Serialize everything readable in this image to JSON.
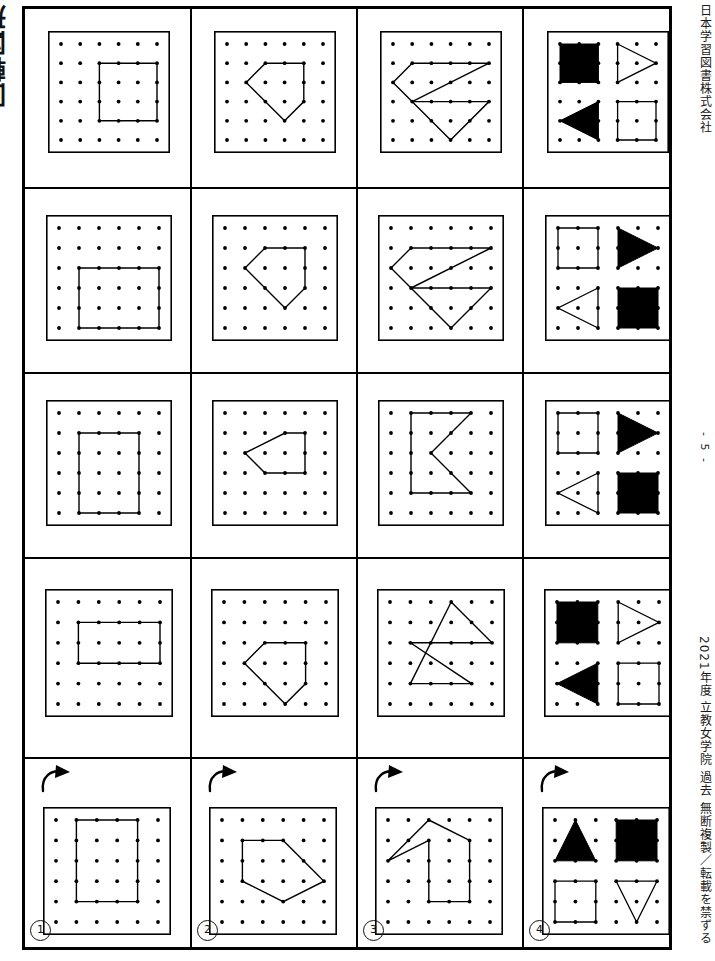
{
  "document": {
    "title": "回転図形",
    "publisher": "日本学習図書株式会社",
    "page_number": "- 5 -",
    "copyright": "2021年度 立教女学院 過去 無断複製／転載を禁ずる"
  },
  "legend": {
    "rotation_arrow_icon": "rotate-clockwise-arrow",
    "grid_rows": 6,
    "grid_cols": 6,
    "dot_color": "#000000",
    "line_color": "#000000",
    "fill_color": "#000000",
    "border_color": "#000000"
  },
  "questions": [
    {
      "number": "①",
      "label": "1"
    },
    {
      "number": "②",
      "label": "2"
    },
    {
      "number": "③",
      "label": "3"
    },
    {
      "number": "④",
      "label": "4"
    }
  ],
  "columns": [
    {
      "index": 1,
      "name": "question-column-1",
      "shape_kind": "rectangle"
    },
    {
      "index": 2,
      "name": "question-column-2",
      "shape_kind": "pentagon"
    },
    {
      "index": 3,
      "name": "question-column-3",
      "shape_kind": "zigzag-arrow"
    },
    {
      "index": 4,
      "name": "question-column-4",
      "shape_kind": "four-quadrant-shapes"
    }
  ],
  "rows": [
    {
      "index": 1,
      "name": "answer-row-a",
      "kind": "answer"
    },
    {
      "index": 2,
      "name": "answer-row-b",
      "kind": "answer"
    },
    {
      "index": 3,
      "name": "answer-row-c",
      "kind": "answer"
    },
    {
      "index": 4,
      "name": "answer-row-d",
      "kind": "answer"
    },
    {
      "index": 5,
      "name": "problem-row",
      "kind": "problem"
    }
  ],
  "boards": {
    "c1r1": {
      "name": "board-col1-row1",
      "type": "polyline",
      "points": "2,1 5,1 5,4 2,4 2,1"
    },
    "c1r2": {
      "name": "board-col1-row2",
      "type": "polyline",
      "points": "1,2 5,2 5,5 1,5 1,2"
    },
    "c1r3": {
      "name": "board-col1-row3",
      "type": "polyline",
      "points": "1,1 4,1 4,5 1,5 1,1"
    },
    "c1r4": {
      "name": "board-col1-row4",
      "type": "polyline",
      "points": "1,1 5,1 5,3 1,3 1,1"
    },
    "c1r5": {
      "name": "board-col1-problem",
      "type": "polyline",
      "points": "1,0 4,0 4,4 1,4 1,0"
    },
    "c2r1": {
      "name": "board-col2-row1",
      "type": "polyline",
      "points": "2,1 4,1 4,3 3,4 1,2 2,1"
    },
    "c2r2": {
      "name": "board-col2-row2",
      "type": "polyline",
      "points": "2,1 4,1 4,3 3,4 1,2 2,1"
    },
    "c2r3": {
      "name": "board-col2-row3",
      "type": "polyline",
      "points": "1,2 3,1 4,1 4,3 2,3 1,2"
    },
    "c2r4": {
      "name": "board-col2-row4",
      "type": "polyline",
      "points": "2,2 4,2 4,4 3,5 1,3 2,2"
    },
    "c2r5": {
      "name": "board-col2-problem",
      "type": "polyline",
      "points": "1,1 3,1 5,3 3,4 1,3 1,1"
    },
    "c3r1": {
      "name": "board-col3-row1",
      "type": "polyline",
      "points": "1,1 5,1 1,3 5,3 3,5 0,2 1,1"
    },
    "c3r2": {
      "name": "board-col3-row2",
      "type": "polyline",
      "points": "1,1 5,1 1,3 5,3 3,5 0,2 1,1"
    },
    "c3r3": {
      "name": "board-col3-row3",
      "type": "polyline",
      "points": "1,0 4,0 2,2 4,4 1,4 1,0"
    },
    "c3r4": {
      "name": "board-col3-row4",
      "type": "polyline",
      "points": "3,0 5,2 1,2 4,4 1,4 3,0"
    },
    "c3r5": {
      "name": "board-col3-problem",
      "type": "polyline",
      "points": "2,0 4,1 4,4 2,4 2,1 0,2 2,0"
    },
    "c4r1": {
      "name": "board-col4-row1",
      "type": "quadrants",
      "shapes": [
        {
          "pos": "top-left",
          "shape": "square",
          "filled": true
        },
        {
          "pos": "top-right",
          "shape": "triangle-right",
          "filled": false
        },
        {
          "pos": "bottom-left",
          "shape": "triangle-left",
          "filled": true
        },
        {
          "pos": "bottom-right",
          "shape": "square",
          "filled": false
        }
      ]
    },
    "c4r2": {
      "name": "board-col4-row2",
      "type": "quadrants",
      "shapes": [
        {
          "pos": "top-left",
          "shape": "square",
          "filled": false
        },
        {
          "pos": "top-right",
          "shape": "triangle-right",
          "filled": true
        },
        {
          "pos": "bottom-left",
          "shape": "triangle-left",
          "filled": false
        },
        {
          "pos": "bottom-right",
          "shape": "square",
          "filled": true
        }
      ]
    },
    "c4r3": {
      "name": "board-col4-row3",
      "type": "quadrants",
      "shapes": [
        {
          "pos": "top-left",
          "shape": "square",
          "filled": false
        },
        {
          "pos": "top-right",
          "shape": "triangle-right",
          "filled": true
        },
        {
          "pos": "bottom-left",
          "shape": "triangle-left",
          "filled": false
        },
        {
          "pos": "bottom-right",
          "shape": "square",
          "filled": true
        }
      ]
    },
    "c4r4": {
      "name": "board-col4-row4",
      "type": "quadrants",
      "shapes": [
        {
          "pos": "top-left",
          "shape": "square",
          "filled": true
        },
        {
          "pos": "top-right",
          "shape": "triangle-right",
          "filled": false
        },
        {
          "pos": "bottom-left",
          "shape": "triangle-left",
          "filled": true
        },
        {
          "pos": "bottom-right",
          "shape": "square",
          "filled": false
        }
      ]
    },
    "c4r5": {
      "name": "board-col4-problem",
      "type": "quadrants",
      "shapes": [
        {
          "pos": "top-left",
          "shape": "triangle-up",
          "filled": true
        },
        {
          "pos": "top-right",
          "shape": "square",
          "filled": true
        },
        {
          "pos": "bottom-left",
          "shape": "square",
          "filled": false
        },
        {
          "pos": "bottom-right",
          "shape": "triangle-down",
          "filled": false
        }
      ]
    }
  }
}
